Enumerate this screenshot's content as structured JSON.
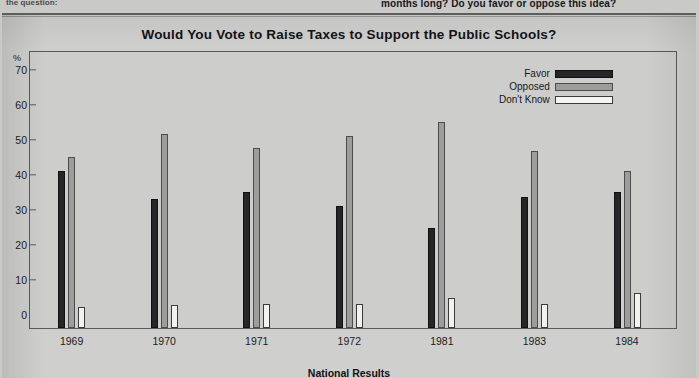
{
  "page": {
    "caption_left": "the question:",
    "caption_right": "months long? Do you favor or oppose this idea?"
  },
  "legend": {
    "items": [
      {
        "label": "Favor",
        "swatch": "black"
      },
      {
        "label": "Opposed",
        "swatch": "gray"
      },
      {
        "label": "Don't Know",
        "swatch": "white"
      }
    ]
  },
  "chart_data": {
    "type": "bar",
    "title": "Would You Vote to Raise Taxes to Support the Public Schools?",
    "xlabel": "National Results",
    "ylabel": "%",
    "categories": [
      "1969",
      "1970",
      "1971",
      "1972",
      "1981",
      "1983",
      "1984"
    ],
    "series": [
      {
        "name": "Favor",
        "color": "#262628",
        "values": [
          45,
          37,
          39,
          35,
          28.5,
          37.5,
          39
        ]
      },
      {
        "name": "Opposed",
        "color": "#9d9d9b",
        "values": [
          49,
          55.5,
          51.5,
          55,
          59,
          50.5,
          45
        ]
      },
      {
        "name": "Don't Know",
        "color": "#f2f2ef",
        "values": [
          6,
          6.5,
          7,
          7,
          8.5,
          7,
          10
        ]
      }
    ],
    "ylim": [
      0,
      75
    ],
    "yticks": [
      0,
      10,
      20,
      30,
      40,
      50,
      60,
      70
    ],
    "ytick_labels": [
      "0",
      "10",
      "20",
      "30",
      "40",
      "50",
      "60",
      "70"
    ],
    "grid": false,
    "legend_position": "top-right"
  }
}
